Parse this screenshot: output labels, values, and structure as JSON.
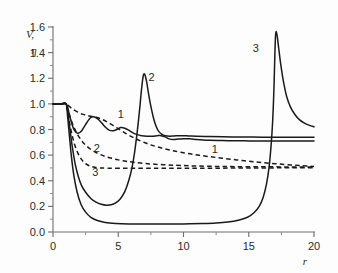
{
  "chart_data": {
    "type": "line",
    "title": "",
    "xlabel": "r",
    "ylabel": "V, η",
    "ylabel_line1": "V,",
    "ylabel_line2": "η",
    "xlim": [
      0,
      20
    ],
    "ylim": [
      0.0,
      1.6
    ],
    "grid": false,
    "legend": "inline-curve-labels",
    "x_ticks": [
      0,
      5,
      10,
      15,
      20
    ],
    "x_tick_labels": [
      "0",
      "5",
      "10",
      "15",
      "20"
    ],
    "x_minor_ticks": [
      2.5,
      7.5,
      12.5,
      17.5
    ],
    "y_ticks": [
      0.0,
      0.2,
      0.4,
      0.6,
      0.8,
      1.0,
      1.2,
      1.4,
      1.6
    ],
    "y_tick_labels": [
      "0.0",
      "0.2",
      "0.4",
      "0.6",
      "0.8",
      "1.0",
      "1.2",
      "1.4",
      "1.6"
    ],
    "y_minor_ticks": [
      0.1,
      0.3,
      0.5,
      0.7,
      0.9,
      1.1,
      1.3,
      1.5
    ],
    "series": [
      {
        "name": "1",
        "style": "solid",
        "label": "1",
        "label_x": 5.2,
        "label_y": 0.92,
        "description": "Velocity V, damped oscillation settling to 0.71",
        "points": [
          [
            0.0,
            1.0
          ],
          [
            0.6,
            1.0
          ],
          [
            1.0,
            1.0
          ],
          [
            1.15,
            0.96
          ],
          [
            1.35,
            0.88
          ],
          [
            1.6,
            0.8
          ],
          [
            1.9,
            0.77
          ],
          [
            2.2,
            0.79
          ],
          [
            2.5,
            0.84
          ],
          [
            2.85,
            0.89
          ],
          [
            3.1,
            0.9
          ],
          [
            3.4,
            0.885
          ],
          [
            3.7,
            0.855
          ],
          [
            4.0,
            0.82
          ],
          [
            4.3,
            0.795
          ],
          [
            4.6,
            0.79
          ],
          [
            4.9,
            0.8
          ],
          [
            5.2,
            0.815
          ],
          [
            5.5,
            0.81
          ],
          [
            5.8,
            0.795
          ],
          [
            6.1,
            0.775
          ],
          [
            6.4,
            0.762
          ],
          [
            6.8,
            0.752
          ],
          [
            7.2,
            0.748
          ],
          [
            7.6,
            0.748
          ],
          [
            8.0,
            0.752
          ],
          [
            8.3,
            0.752
          ],
          [
            8.6,
            0.742
          ],
          [
            8.9,
            0.727
          ],
          [
            9.2,
            0.722
          ],
          [
            9.6,
            0.725
          ],
          [
            10.0,
            0.728
          ],
          [
            10.5,
            0.727
          ],
          [
            11.0,
            0.722
          ],
          [
            11.5,
            0.718
          ],
          [
            12.0,
            0.716
          ],
          [
            13.0,
            0.714
          ],
          [
            14.0,
            0.712
          ],
          [
            15.0,
            0.711
          ],
          [
            16.0,
            0.71
          ],
          [
            17.0,
            0.71
          ],
          [
            18.0,
            0.71
          ],
          [
            19.0,
            0.71
          ],
          [
            20.0,
            0.71
          ]
        ]
      },
      {
        "name": "2",
        "style": "solid",
        "label": "2",
        "label_x": 7.55,
        "label_y": 1.21,
        "description": "Velocity V, deep dip to 0.21 then sharp peak 1.23 at r=6.9",
        "points": [
          [
            0.0,
            1.0
          ],
          [
            0.6,
            1.0
          ],
          [
            1.0,
            1.0
          ],
          [
            1.15,
            0.92
          ],
          [
            1.3,
            0.8
          ],
          [
            1.5,
            0.65
          ],
          [
            1.7,
            0.53
          ],
          [
            1.95,
            0.43
          ],
          [
            2.2,
            0.36
          ],
          [
            2.5,
            0.31
          ],
          [
            2.9,
            0.262
          ],
          [
            3.3,
            0.233
          ],
          [
            3.7,
            0.216
          ],
          [
            4.1,
            0.209
          ],
          [
            4.45,
            0.212
          ],
          [
            4.8,
            0.227
          ],
          [
            5.15,
            0.258
          ],
          [
            5.5,
            0.315
          ],
          [
            5.8,
            0.4
          ],
          [
            6.05,
            0.5
          ],
          [
            6.25,
            0.62
          ],
          [
            6.45,
            0.78
          ],
          [
            6.62,
            0.94
          ],
          [
            6.76,
            1.09
          ],
          [
            6.87,
            1.19
          ],
          [
            6.95,
            1.232
          ],
          [
            7.05,
            1.225
          ],
          [
            7.18,
            1.17
          ],
          [
            7.32,
            1.08
          ],
          [
            7.5,
            0.98
          ],
          [
            7.7,
            0.89
          ],
          [
            7.9,
            0.825
          ],
          [
            8.1,
            0.785
          ],
          [
            8.35,
            0.762
          ],
          [
            8.6,
            0.752
          ],
          [
            8.95,
            0.748
          ],
          [
            9.3,
            0.75
          ],
          [
            9.8,
            0.752
          ],
          [
            10.4,
            0.75
          ],
          [
            11.0,
            0.748
          ],
          [
            12.0,
            0.745
          ],
          [
            13.0,
            0.743
          ],
          [
            14.0,
            0.742
          ],
          [
            15.0,
            0.741
          ],
          [
            16.0,
            0.74
          ],
          [
            17.0,
            0.74
          ],
          [
            18.0,
            0.74
          ],
          [
            19.0,
            0.74
          ],
          [
            20.0,
            0.74
          ]
        ]
      },
      {
        "name": "3",
        "style": "solid",
        "label": "3",
        "label_x": 15.55,
        "label_y": 1.44,
        "description": "Velocity V, long low plateau 0.065 then sharp peak 1.56 at r=17",
        "points": [
          [
            0.0,
            1.0
          ],
          [
            0.6,
            1.0
          ],
          [
            1.0,
            1.0
          ],
          [
            1.12,
            0.9
          ],
          [
            1.25,
            0.76
          ],
          [
            1.4,
            0.6
          ],
          [
            1.6,
            0.44
          ],
          [
            1.85,
            0.31
          ],
          [
            2.15,
            0.215
          ],
          [
            2.5,
            0.155
          ],
          [
            2.9,
            0.115
          ],
          [
            3.4,
            0.09
          ],
          [
            4.0,
            0.075
          ],
          [
            4.8,
            0.067
          ],
          [
            5.8,
            0.063
          ],
          [
            7.0,
            0.062
          ],
          [
            8.5,
            0.062
          ],
          [
            10.0,
            0.063
          ],
          [
            11.5,
            0.066
          ],
          [
            12.5,
            0.07
          ],
          [
            13.4,
            0.078
          ],
          [
            14.2,
            0.092
          ],
          [
            14.9,
            0.115
          ],
          [
            15.4,
            0.15
          ],
          [
            15.8,
            0.2
          ],
          [
            16.1,
            0.27
          ],
          [
            16.35,
            0.37
          ],
          [
            16.55,
            0.5
          ],
          [
            16.7,
            0.66
          ],
          [
            16.83,
            0.86
          ],
          [
            16.93,
            1.12
          ],
          [
            17.0,
            1.38
          ],
          [
            17.05,
            1.53
          ],
          [
            17.1,
            1.565
          ],
          [
            17.18,
            1.53
          ],
          [
            17.3,
            1.43
          ],
          [
            17.45,
            1.31
          ],
          [
            17.65,
            1.18
          ],
          [
            17.9,
            1.06
          ],
          [
            18.2,
            0.975
          ],
          [
            18.55,
            0.915
          ],
          [
            18.9,
            0.875
          ],
          [
            19.3,
            0.848
          ],
          [
            19.65,
            0.832
          ],
          [
            20.0,
            0.822
          ]
        ]
      },
      {
        "name": "1d",
        "style": "dashed",
        "label": "1",
        "label_x": 12.4,
        "label_y": 0.645,
        "description": "Porosity eta, slow monotone decay toward 0.51",
        "points": [
          [
            0.0,
            1.0
          ],
          [
            0.6,
            1.0
          ],
          [
            1.0,
            1.0
          ],
          [
            1.2,
            0.985
          ],
          [
            1.5,
            0.96
          ],
          [
            1.9,
            0.935
          ],
          [
            2.3,
            0.918
          ],
          [
            2.7,
            0.908
          ],
          [
            3.0,
            0.902
          ],
          [
            3.3,
            0.896
          ],
          [
            3.7,
            0.882
          ],
          [
            4.1,
            0.862
          ],
          [
            4.5,
            0.838
          ],
          [
            4.9,
            0.812
          ],
          [
            5.3,
            0.787
          ],
          [
            5.7,
            0.762
          ],
          [
            6.1,
            0.74
          ],
          [
            6.5,
            0.72
          ],
          [
            7.0,
            0.698
          ],
          [
            7.5,
            0.68
          ],
          [
            8.0,
            0.664
          ],
          [
            8.6,
            0.648
          ],
          [
            9.2,
            0.634
          ],
          [
            9.8,
            0.622
          ],
          [
            10.5,
            0.61
          ],
          [
            11.2,
            0.599
          ],
          [
            12.0,
            0.588
          ],
          [
            12.8,
            0.578
          ],
          [
            13.6,
            0.568
          ],
          [
            14.4,
            0.559
          ],
          [
            15.2,
            0.55
          ],
          [
            16.0,
            0.542
          ],
          [
            17.0,
            0.533
          ],
          [
            18.0,
            0.525
          ],
          [
            19.0,
            0.518
          ],
          [
            20.0,
            0.512
          ]
        ]
      },
      {
        "name": "2d",
        "style": "dashed",
        "label": "2",
        "label_x": 3.35,
        "label_y": 0.655,
        "description": "Porosity eta, faster decay to near 0.51 plateau",
        "points": [
          [
            0.0,
            1.0
          ],
          [
            0.6,
            1.0
          ],
          [
            1.0,
            1.0
          ],
          [
            1.15,
            0.95
          ],
          [
            1.35,
            0.885
          ],
          [
            1.6,
            0.818
          ],
          [
            1.9,
            0.758
          ],
          [
            2.2,
            0.712
          ],
          [
            2.5,
            0.678
          ],
          [
            2.85,
            0.648
          ],
          [
            3.2,
            0.626
          ],
          [
            3.6,
            0.606
          ],
          [
            4.0,
            0.59
          ],
          [
            4.5,
            0.575
          ],
          [
            5.0,
            0.563
          ],
          [
            5.6,
            0.552
          ],
          [
            6.2,
            0.544
          ],
          [
            7.0,
            0.535
          ],
          [
            7.8,
            0.529
          ],
          [
            8.8,
            0.523
          ],
          [
            9.8,
            0.519
          ],
          [
            11.0,
            0.515
          ],
          [
            12.5,
            0.512
          ],
          [
            14.0,
            0.51
          ],
          [
            16.0,
            0.509
          ],
          [
            18.0,
            0.508
          ],
          [
            20.0,
            0.508
          ]
        ]
      },
      {
        "name": "3d",
        "style": "dashed",
        "label": "3",
        "label_x": 3.25,
        "label_y": 0.465,
        "description": "Porosity eta, rapid drop to flat 0.50 plateau",
        "points": [
          [
            0.0,
            1.0
          ],
          [
            0.6,
            1.0
          ],
          [
            1.0,
            1.0
          ],
          [
            1.12,
            0.93
          ],
          [
            1.28,
            0.845
          ],
          [
            1.45,
            0.762
          ],
          [
            1.65,
            0.685
          ],
          [
            1.9,
            0.618
          ],
          [
            2.2,
            0.565
          ],
          [
            2.5,
            0.533
          ],
          [
            2.85,
            0.514
          ],
          [
            3.2,
            0.505
          ],
          [
            3.6,
            0.5
          ],
          [
            4.2,
            0.498
          ],
          [
            5.0,
            0.497
          ],
          [
            6.0,
            0.497
          ],
          [
            8.0,
            0.497
          ],
          [
            10.0,
            0.497
          ],
          [
            12.0,
            0.498
          ],
          [
            14.0,
            0.499
          ],
          [
            16.0,
            0.5
          ],
          [
            18.0,
            0.501
          ],
          [
            20.0,
            0.502
          ]
        ]
      }
    ],
    "colors": {
      "curve": "#1a1a1a",
      "axis": "#6e6e6e",
      "text": "#2b2b2b",
      "background": "#fdfdfd"
    }
  }
}
